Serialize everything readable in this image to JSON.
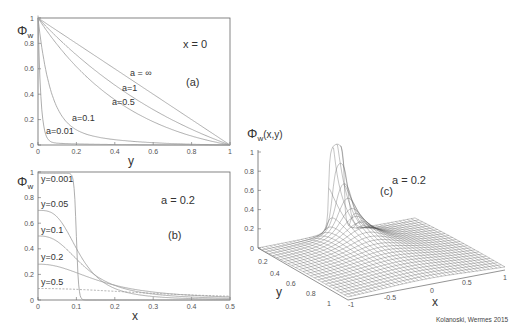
{
  "credit": "Kolanoski, Wermes 2015",
  "panels": {
    "a": {
      "label": "(a)",
      "condition": "x = 0",
      "ylabel": "Φ",
      "ysub": "w",
      "xlabel": "y",
      "xticks": [
        "0",
        "0.2",
        "0.4",
        "0.6",
        "0.8",
        "1"
      ],
      "yticks": [
        "0",
        "0.2",
        "0.4",
        "0.6",
        "0.8",
        "1"
      ],
      "curve_labels": [
        "a = ∞",
        "a=1",
        "a=0.5",
        "a=0.1",
        "a=0.01"
      ]
    },
    "b": {
      "label": "(b)",
      "condition": "a = 0.2",
      "ylabel": "Φ",
      "ysub": "w",
      "xlabel": "x",
      "xticks": [
        "0",
        "0.1",
        "0.2",
        "0.3",
        "0.4",
        "0.5"
      ],
      "yticks": [
        "0",
        "0.2",
        "0.4",
        "0.6",
        "0.8",
        "1"
      ],
      "curve_labels": [
        "y=0.001",
        "y=0.05",
        "y=0.1",
        "y=0.2",
        "y=0.5"
      ]
    },
    "c": {
      "label": "(c)",
      "condition": "a = 0.2",
      "zlabel": "Φ",
      "zsub": "w",
      "zarg": "(x,y)",
      "xlabel": "x",
      "ylabel": "y",
      "zticks": [
        "0",
        "0.2",
        "0.4",
        "0.6",
        "0.8",
        "1"
      ],
      "yticks": [
        "0.2",
        "0.4",
        "0.6",
        "0.8",
        "1"
      ],
      "xticks": [
        "-1",
        "-0.5",
        "0",
        "0.5",
        "1"
      ]
    }
  },
  "chart_data": [
    {
      "type": "line",
      "title": "(a) x = 0",
      "xlabel": "y",
      "ylabel": "Φw",
      "xlim": [
        0,
        1
      ],
      "ylim": [
        0,
        1
      ],
      "x": [
        0,
        0.1,
        0.2,
        0.3,
        0.4,
        0.5,
        0.6,
        0.7,
        0.8,
        0.9,
        1.0
      ],
      "series": [
        {
          "name": "a = ∞",
          "values": [
            1.0,
            0.9,
            0.8,
            0.7,
            0.6,
            0.5,
            0.4,
            0.3,
            0.2,
            0.1,
            0.0
          ]
        },
        {
          "name": "a=1",
          "values": [
            1.0,
            0.82,
            0.67,
            0.54,
            0.43,
            0.34,
            0.26,
            0.19,
            0.12,
            0.06,
            0.0
          ]
        },
        {
          "name": "a=0.5",
          "values": [
            1.0,
            0.7,
            0.5,
            0.37,
            0.28,
            0.21,
            0.15,
            0.11,
            0.07,
            0.03,
            0.0
          ]
        },
        {
          "name": "a=0.1",
          "values": [
            1.0,
            0.32,
            0.15,
            0.09,
            0.06,
            0.04,
            0.03,
            0.02,
            0.015,
            0.007,
            0.0
          ]
        },
        {
          "name": "a=0.01",
          "values": [
            1.0,
            0.04,
            0.02,
            0.01,
            0.008,
            0.006,
            0.005,
            0.004,
            0.003,
            0.001,
            0.0
          ]
        }
      ],
      "grid": false
    },
    {
      "type": "line",
      "title": "(b) a = 0.2",
      "xlabel": "x",
      "ylabel": "Φw",
      "xlim": [
        0,
        0.5
      ],
      "ylim": [
        0,
        1
      ],
      "x": [
        0,
        0.05,
        0.08,
        0.1,
        0.12,
        0.15,
        0.2,
        0.3,
        0.4,
        0.5
      ],
      "series": [
        {
          "name": "y=0.001",
          "values": [
            0.99,
            0.99,
            0.97,
            0.5,
            0.02,
            0.005,
            0.002,
            0.001,
            0.001,
            0.0
          ]
        },
        {
          "name": "y=0.05",
          "values": [
            0.7,
            0.64,
            0.55,
            0.45,
            0.33,
            0.2,
            0.1,
            0.05,
            0.03,
            0.02
          ]
        },
        {
          "name": "y=0.1",
          "values": [
            0.5,
            0.46,
            0.41,
            0.37,
            0.31,
            0.23,
            0.14,
            0.07,
            0.04,
            0.03
          ]
        },
        {
          "name": "y=0.2",
          "values": [
            0.28,
            0.27,
            0.25,
            0.24,
            0.22,
            0.19,
            0.14,
            0.08,
            0.05,
            0.03
          ]
        },
        {
          "name": "y=0.5",
          "values": [
            0.09,
            0.09,
            0.09,
            0.09,
            0.085,
            0.08,
            0.07,
            0.05,
            0.04,
            0.03
          ]
        }
      ],
      "grid": false
    },
    {
      "type": "surface",
      "title": "(c) a = 0.2",
      "xlabel": "x",
      "ylabel": "y",
      "zlabel": "Φw(x,y)",
      "xlim": [
        -1,
        1
      ],
      "ylim": [
        0,
        1
      ],
      "zlim": [
        0,
        1
      ],
      "description": "Weighting potential surface: sharp peak (≈1) near x≈0, y→0, decaying rapidly to 0 elsewhere"
    }
  ]
}
